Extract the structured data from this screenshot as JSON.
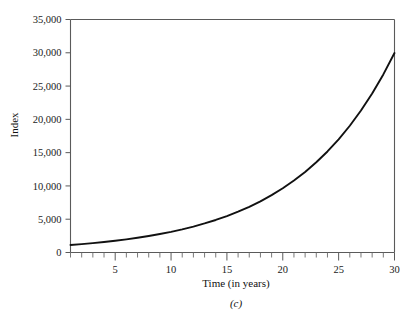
{
  "figure": {
    "caption": "(c)",
    "background_color": "#ffffff",
    "line_color": "#111111",
    "axis_color": "#5a5a5a"
  },
  "chart_data": {
    "type": "line",
    "title": "",
    "subtitle": "",
    "xlabel": "Time (in years)",
    "ylabel": "Index",
    "caption": "(c)",
    "xlim": [
      1,
      30
    ],
    "ylim": [
      0,
      35000
    ],
    "grid": false,
    "legend": false,
    "legend_position": "none",
    "x_tick_labels": [
      "5",
      "10",
      "15",
      "20",
      "25",
      "30"
    ],
    "x_tick_values": [
      5,
      10,
      15,
      20,
      25,
      30
    ],
    "x_minor_tick_values": [
      1,
      2,
      3,
      4,
      5,
      6,
      7,
      8,
      9,
      10,
      11,
      12,
      13,
      14,
      15,
      16,
      17,
      18,
      19,
      20,
      21,
      22,
      23,
      24,
      25,
      26,
      27,
      28,
      29,
      30
    ],
    "y_tick_labels": [
      "0",
      "5,000",
      "10,000",
      "15,000",
      "20,000",
      "25,000",
      "30,000",
      "35,000"
    ],
    "y_tick_values": [
      0,
      5000,
      10000,
      15000,
      20000,
      25000,
      30000,
      35000
    ],
    "series": [
      {
        "name": "Index",
        "x": [
          1,
          2,
          3,
          4,
          5,
          6,
          7,
          8,
          9,
          10,
          11,
          12,
          13,
          14,
          15,
          16,
          17,
          18,
          19,
          20,
          21,
          22,
          23,
          24,
          25,
          26,
          27,
          28,
          29,
          30
        ],
        "values": [
          1120,
          1254,
          1405,
          1574,
          1762,
          1974,
          2211,
          2476,
          2773,
          3106,
          3479,
          3896,
          4363,
          4887,
          5474,
          6130,
          6866,
          7690,
          8613,
          9646,
          10804,
          12100,
          13552,
          15179,
          17000,
          19040,
          21325,
          23884,
          26750,
          29961
        ]
      }
    ],
    "annotations": []
  }
}
